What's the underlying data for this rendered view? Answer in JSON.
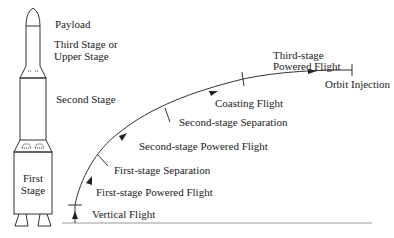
{
  "rocket": {
    "labels": {
      "payload": "Payload",
      "third_stage_line1": "Third Stage or",
      "third_stage_line2": "Upper Stage",
      "second_stage": "Second Stage",
      "first_stage_line1": "First",
      "first_stage_line2": "Stage"
    }
  },
  "trajectory": {
    "phases": {
      "vertical_flight": "Vertical Flight",
      "first_stage_powered": "First-stage Powered Flight",
      "first_stage_separation": "First-stage Separation",
      "second_stage_powered": "Second-stage Powered Flight",
      "second_stage_separation": "Second-stage Separation",
      "coasting_flight": "Coasting Flight",
      "third_stage_line1": "Third-stage",
      "third_stage_line2": "Powered Flight",
      "orbit_injection": "Orbit Injection"
    }
  },
  "colors": {
    "line": "#333333",
    "ground": "#999999"
  }
}
